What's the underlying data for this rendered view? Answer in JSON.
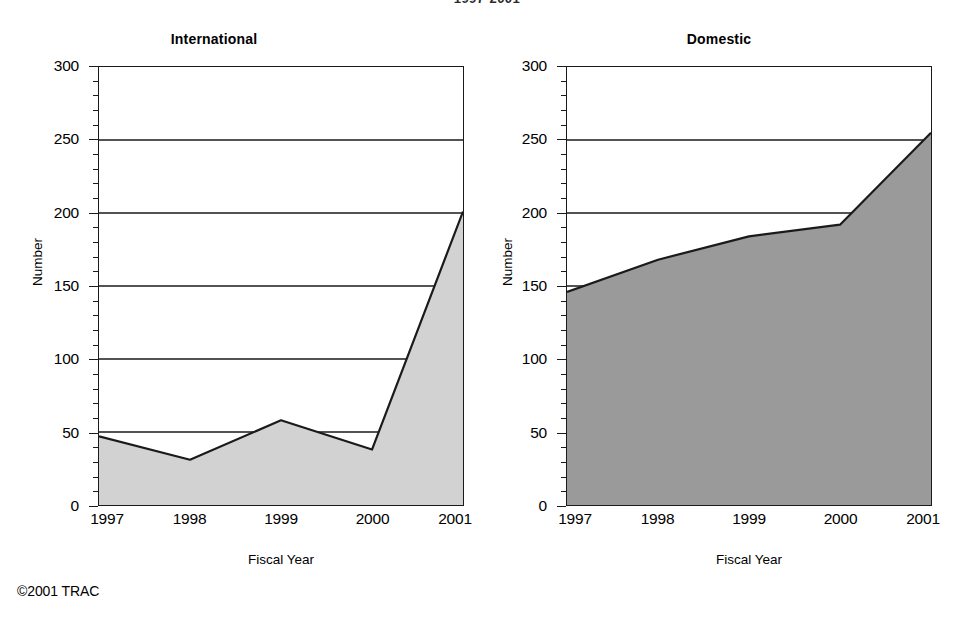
{
  "super_title": "1997-2001",
  "copyright": "©2001 TRAC",
  "panels": [
    {
      "key": "international",
      "title": "International",
      "xlabel": "Fiscal Year",
      "ylabel": "Number",
      "fill_color": "#d2d2d2",
      "line_color": "#1a1a1a"
    },
    {
      "key": "domestic",
      "title": "Domestic",
      "xlabel": "Fiscal Year",
      "ylabel": "Number",
      "fill_color": "#9a9a9a",
      "line_color": "#1a1a1a"
    }
  ],
  "axis": {
    "y_ticks": [
      0,
      50,
      100,
      150,
      200,
      250,
      300
    ],
    "y_tick_labels": [
      "0",
      "50",
      "100",
      "150",
      "200",
      "250",
      "300"
    ],
    "y_minor_step": 10,
    "ylim": [
      0,
      300
    ],
    "x_ticks": [
      "1997",
      "1998",
      "1999",
      "2000",
      "2001"
    ]
  },
  "chart_data": [
    {
      "type": "area",
      "title": "International",
      "subtitle": "1997-2001",
      "xlabel": "Fiscal Year",
      "ylabel": "Number",
      "categories": [
        "1997",
        "1998",
        "1999",
        "2000",
        "2001"
      ],
      "values": [
        47,
        31,
        58,
        38,
        201
      ],
      "ylim": [
        0,
        300
      ],
      "ytick_step": 50,
      "yminor_step": 10,
      "grid": "horizontal-major-only",
      "legend": "none",
      "fill_color": "#d2d2d2",
      "line_color": "#1a1a1a"
    },
    {
      "type": "area",
      "title": "Domestic",
      "subtitle": "1997-2001",
      "xlabel": "Fiscal Year",
      "ylabel": "Number",
      "categories": [
        "1997",
        "1998",
        "1999",
        "2000",
        "2001"
      ],
      "values": [
        146,
        168,
        184,
        192,
        255
      ],
      "ylim": [
        0,
        300
      ],
      "ytick_step": 50,
      "yminor_step": 10,
      "grid": "horizontal-major-only",
      "legend": "none",
      "fill_color": "#9a9a9a",
      "line_color": "#1a1a1a"
    }
  ]
}
